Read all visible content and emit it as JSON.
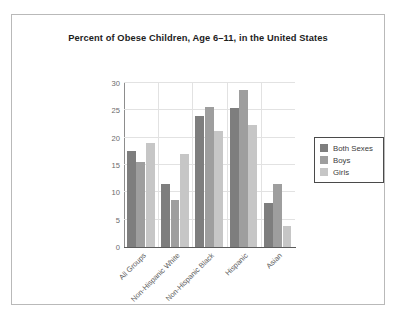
{
  "chart_data": {
    "type": "bar",
    "title": "Percent of Obese Children, Age 6–11, in the United States",
    "xlabel": "",
    "ylabel": "",
    "ylim": [
      0,
      30
    ],
    "yticks": [
      0,
      5,
      10,
      15,
      20,
      25,
      30
    ],
    "grid": true,
    "legend_position": "right",
    "categories": [
      "All Groups",
      "Non-Hispanic White",
      "Non-Hispanic Black",
      "Hispanic",
      "Asian"
    ],
    "series": [
      {
        "name": "Both Sexes",
        "color": "#7e7e7e",
        "values": [
          17.5,
          11.5,
          24.0,
          25.4,
          8.1
        ]
      },
      {
        "name": "Boys",
        "color": "#9e9e9e",
        "values": [
          15.6,
          8.6,
          25.6,
          28.7,
          11.5
        ]
      },
      {
        "name": "Girls",
        "color": "#c6c6c6",
        "values": [
          19.0,
          17.1,
          21.3,
          22.3,
          3.9
        ]
      }
    ]
  },
  "figure": {
    "background_color": "#ffffff",
    "frame_color": "#b9b9b9"
  }
}
